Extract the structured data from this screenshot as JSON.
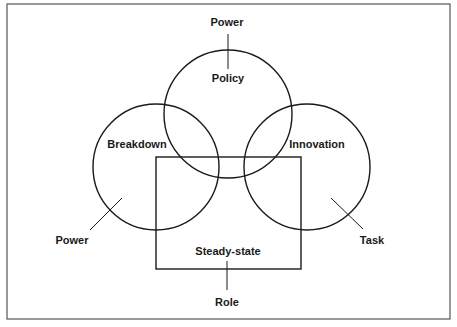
{
  "diagram": {
    "type": "venn-with-rectangle",
    "colors": {
      "stroke": "#1a1a1a",
      "frame": "#555555",
      "background": "#ffffff"
    },
    "circles": [
      {
        "id": "policy",
        "label": "Policy",
        "cx": 228,
        "cy": 114,
        "r": 64,
        "external_label": "Power"
      },
      {
        "id": "breakdown",
        "label": "Breakdown",
        "cx": 156,
        "cy": 167,
        "r": 63,
        "external_label": "Power"
      },
      {
        "id": "innovation",
        "label": "Innovation",
        "cx": 307,
        "cy": 167,
        "r": 63,
        "external_label": "Task"
      }
    ],
    "rectangle": {
      "id": "steady-state",
      "label": "Steady-state",
      "x": 156,
      "y": 157,
      "width": 145,
      "height": 112,
      "external_label": "Role"
    }
  },
  "labels": {
    "policy": "Policy",
    "breakdown": "Breakdown",
    "innovation": "Innovation",
    "steady_state": "Steady-state",
    "top_power": "Power",
    "left_power": "Power",
    "task": "Task",
    "role": "Role"
  }
}
